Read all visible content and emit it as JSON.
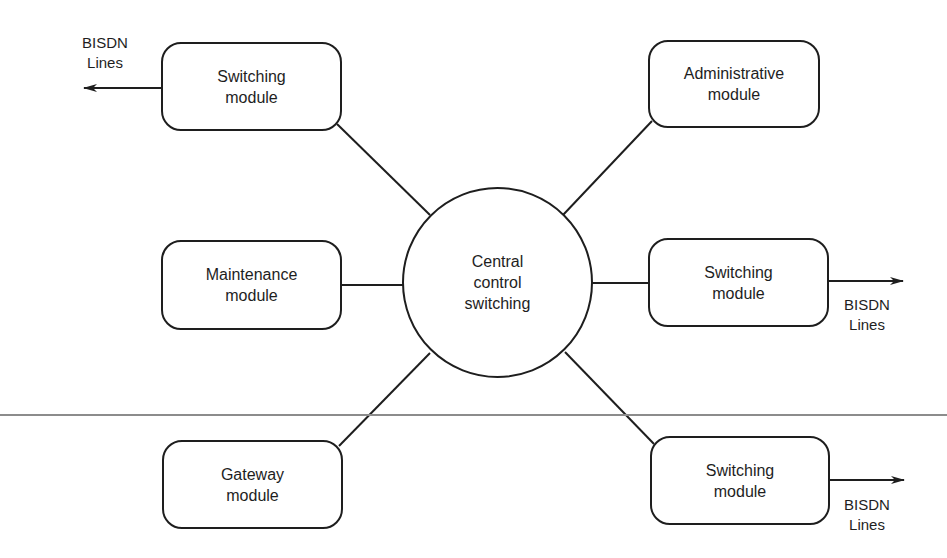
{
  "diagram": {
    "center": {
      "lines": [
        "Central",
        "control",
        "switching"
      ]
    },
    "modules": [
      {
        "id": "switching-top-left",
        "lines": [
          "Switching",
          "module"
        ]
      },
      {
        "id": "administrative",
        "lines": [
          "Administrative",
          "module"
        ]
      },
      {
        "id": "maintenance",
        "lines": [
          "Maintenance",
          "module"
        ]
      },
      {
        "id": "switching-mid-right",
        "lines": [
          "Switching",
          "module"
        ]
      },
      {
        "id": "gateway",
        "lines": [
          "Gateway",
          "module"
        ]
      },
      {
        "id": "switching-bottom-right",
        "lines": [
          "Switching",
          "module"
        ]
      }
    ],
    "external_labels": [
      {
        "for": "switching-top-left",
        "lines": [
          "BISDN",
          "Lines"
        ],
        "direction": "left"
      },
      {
        "for": "switching-mid-right",
        "lines": [
          "BISDN",
          "Lines"
        ],
        "direction": "right"
      },
      {
        "for": "switching-bottom-right",
        "lines": [
          "BISDN",
          "Lines"
        ],
        "direction": "right"
      }
    ],
    "colors": {
      "stroke": "#1e1e1e",
      "rule": "#8c8c8c",
      "background": "#ffffff"
    }
  }
}
